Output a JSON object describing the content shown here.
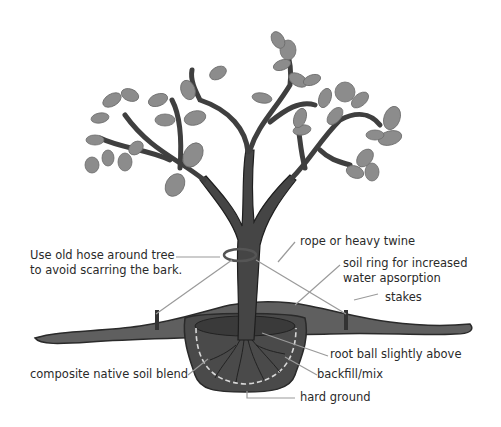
{
  "diagram": {
    "labels": {
      "hose": [
        "Use old hose around tree",
        "to avoid scarring the bark."
      ],
      "rope": "rope or heavy twine",
      "soil_ring": [
        "soil ring for increased",
        "water apsorption"
      ],
      "stakes": "stakes",
      "root_ball": "root ball slightly above",
      "composite": "composite native soil blend",
      "backfill": "backfill/mix",
      "hard_ground": "hard ground"
    },
    "colors": {
      "trunk": "#3f3f3f",
      "leaf": "#8a8a8a",
      "soil_surface": "#5e5e5e",
      "hole": "#3a3a3a",
      "leader_line": "#9a9a9a",
      "text": "#2a2a2a"
    }
  }
}
